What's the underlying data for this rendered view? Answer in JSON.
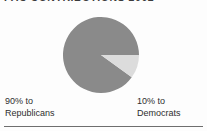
{
  "figure": {
    "title": "PAC CONTRIBUTIONS 2002",
    "background_color": "#fdfdfd",
    "rule_color": "#6e6e6e"
  },
  "labels": {
    "left": {
      "percent_line": "90% to",
      "name_line": "Republicans"
    },
    "right": {
      "percent_line": "10% to",
      "name_line": "Democrats"
    }
  },
  "chart_data": {
    "type": "pie",
    "title": "PAC CONTRIBUTIONS 2002",
    "categories": [
      "Republicans",
      "Democrats"
    ],
    "values": [
      90,
      10
    ],
    "value_unit": "%",
    "data_labels": [
      "90% to Republicans",
      "10% to Democrats"
    ],
    "colors": [
      "#8a8a8a",
      "#dcdcdc"
    ],
    "edge_color": "#8a8a8a",
    "start_angle_deg": 0,
    "direction": "clockwise",
    "legend": "none",
    "legend_position": "below-slices",
    "grid": false,
    "xlabel": "",
    "ylabel": ""
  }
}
